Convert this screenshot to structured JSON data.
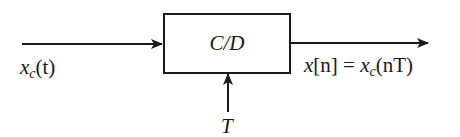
{
  "diagram": {
    "type": "block-diagram",
    "block": {
      "label": "C/D"
    },
    "input": {
      "signal": "x",
      "subscript": "c",
      "argument": "(t)"
    },
    "output": {
      "lhs_signal": "x",
      "lhs_index": "[n]",
      "equals": "=",
      "rhs_signal": "x",
      "rhs_subscript": "c",
      "rhs_argument": "(nT)"
    },
    "control": {
      "label": "T"
    },
    "colors": {
      "stroke": "#1a1a1a",
      "background": "#ffffff"
    }
  }
}
